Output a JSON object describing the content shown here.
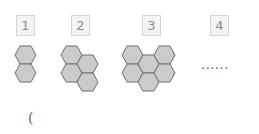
{
  "diagram": {
    "labels": [
      "1",
      "2",
      "3",
      "4"
    ],
    "figures": [
      {
        "label": "1",
        "hexagon_count": 2
      },
      {
        "label": "2",
        "hexagon_count": 4
      },
      {
        "label": "3",
        "hexagon_count": 6
      },
      {
        "label": "4",
        "hexagon_count": null
      }
    ],
    "continuation": "......",
    "answer_paren": "(",
    "colors": {
      "hex_fill": "#cbcbcb",
      "hex_stroke": "#6e6e6e",
      "label_box_bg": "#f3f3f3",
      "label_text": "#8c8c8c"
    }
  }
}
